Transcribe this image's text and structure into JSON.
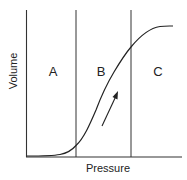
{
  "diagram": {
    "type": "pressure-volume curve",
    "axes": {
      "x_label": "Pressure",
      "y_label": "Volume"
    },
    "regions": [
      {
        "label": "A"
      },
      {
        "label": "B"
      },
      {
        "label": "C"
      }
    ],
    "curve": {
      "shape": "sigmoid",
      "direction_arrow": "increasing"
    },
    "colors": {
      "line": "#222222",
      "background": "#ffffff"
    }
  }
}
